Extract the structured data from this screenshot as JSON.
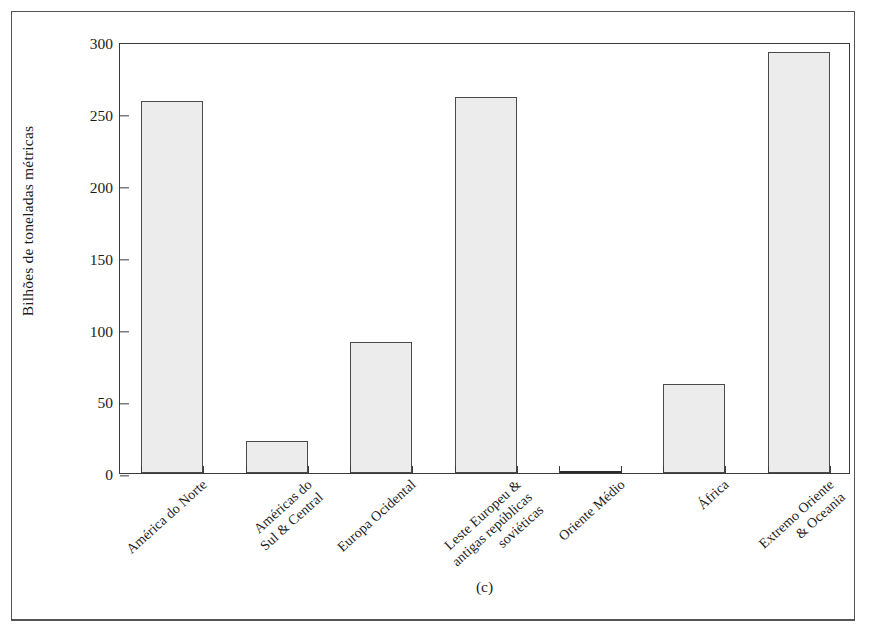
{
  "figure": {
    "caption": "(c)",
    "frame_color": "#555555",
    "bar_fill": "#ececec",
    "bar_stroke": "#4a4a4a"
  },
  "chart_data": {
    "type": "bar",
    "title": "",
    "xlabel": "",
    "ylabel": "Bilhões de toneladas métricas",
    "ylim": [
      0,
      300
    ],
    "yticks": [
      0,
      50,
      100,
      150,
      200,
      250,
      300
    ],
    "grid": false,
    "legend": false,
    "categories": [
      "América do Norte",
      "Américas do\nSul & Central",
      "Europa Ocidental",
      "Leste Europeu &\nantigas repúblicas\nsoviéticas",
      "Oriente Médio",
      "África",
      "Extremo Oriente\n& Oceania"
    ],
    "values": [
      259,
      22,
      91,
      262,
      1,
      62,
      293
    ]
  }
}
